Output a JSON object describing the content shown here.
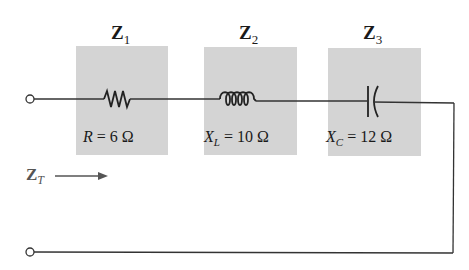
{
  "diagram": {
    "type": "series RLC impedance circuit",
    "impedances": [
      {
        "label": "Z",
        "sub": "1",
        "element": "resistor",
        "quantity": "R",
        "quantity_sub": "",
        "value": "6 Ω"
      },
      {
        "label": "Z",
        "sub": "2",
        "element": "inductor",
        "quantity": "X",
        "quantity_sub": "L",
        "value": "10 Ω"
      },
      {
        "label": "Z",
        "sub": "3",
        "element": "capacitor",
        "quantity": "X",
        "quantity_sub": "C",
        "value": "12 Ω"
      }
    ],
    "total": {
      "label": "Z",
      "sub": "T",
      "arrow": "right"
    },
    "colors": {
      "box": "#d4d4d4",
      "wire": "#333333",
      "background": "#ffffff"
    }
  }
}
